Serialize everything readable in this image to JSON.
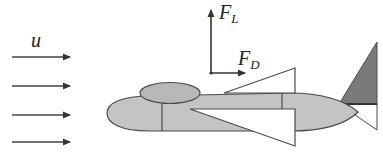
{
  "diagram": {
    "flow_label": "u",
    "flow_arrow_count": 4,
    "lift_label": {
      "main": "F",
      "sub": "L"
    },
    "drag_label": {
      "main": "F",
      "sub": "D"
    },
    "colors": {
      "body_fill": "#c4c4c4",
      "canopy_fill": "#b8b8b8",
      "tail_fill": "#7a7a7a",
      "stroke": "#4a4a4a",
      "wing_fill": "#ffffff"
    }
  }
}
